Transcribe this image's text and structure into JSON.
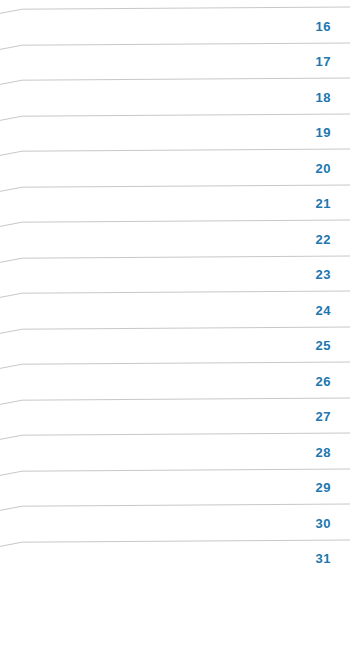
{
  "view": {
    "type": "day-list",
    "background_color": "#ffffff",
    "rule_color": "#c8c8c8",
    "number_color": "#2176ae",
    "row_count": 16,
    "first_day": 16,
    "last_day": 31
  },
  "days": [
    {
      "label": "16"
    },
    {
      "label": "17"
    },
    {
      "label": "18"
    },
    {
      "label": "19"
    },
    {
      "label": "20"
    },
    {
      "label": "21"
    },
    {
      "label": "22"
    },
    {
      "label": "23"
    },
    {
      "label": "24"
    },
    {
      "label": "25"
    },
    {
      "label": "26"
    },
    {
      "label": "27"
    },
    {
      "label": "28"
    },
    {
      "label": "29"
    },
    {
      "label": "30"
    },
    {
      "label": "31"
    }
  ]
}
